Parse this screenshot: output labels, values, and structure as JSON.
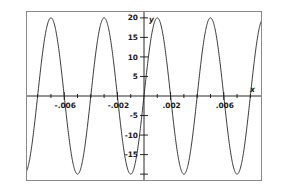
{
  "figure": {
    "background_color": "#ffffff",
    "frame_color": "#8a8a8a",
    "curve_color": "#222222",
    "axis_color": "#111111"
  },
  "axes": {
    "x_axis_name": "x",
    "y_axis_name": "y",
    "x_tick_labels": [
      "-.006",
      "-.002",
      ".002",
      ".006"
    ],
    "x_tick_values": [
      -0.006,
      -0.002,
      0.002,
      0.006
    ],
    "y_tick_labels": [
      "20",
      "15",
      "10",
      "5",
      "-5",
      "-10",
      "-15"
    ],
    "y_tick_values": [
      20,
      15,
      10,
      5,
      -5,
      -10,
      -15
    ]
  },
  "chart_data": {
    "type": "line",
    "title": "",
    "xlabel": "x",
    "ylabel": "y",
    "xlim": [
      -0.0088,
      0.0088
    ],
    "ylim": [
      -21.5,
      21.5
    ],
    "grid": false,
    "legend": null,
    "x_tick_labels": [
      "-.006",
      "-.002",
      ".002",
      ".006"
    ],
    "x_ticks": [
      -0.006,
      -0.002,
      0.002,
      0.006
    ],
    "x_minor_ticks": [
      -0.008,
      -0.007,
      -0.005,
      -0.004,
      -0.003,
      -0.001,
      0.001,
      0.003,
      0.004,
      0.005,
      0.007,
      0.008
    ],
    "y_ticks": [
      -20,
      -15,
      -10,
      -5,
      5,
      10,
      15,
      20
    ],
    "y_tick_labels": [
      "",
      "-15",
      "-10",
      "-5",
      "5",
      "10",
      "15",
      "20"
    ],
    "series": [
      {
        "name": "y",
        "function": "20*sin(2*pi*x/0.004)",
        "amplitude": 20,
        "period": 0.004,
        "phase": 0,
        "x": [
          -0.0088,
          -0.0085,
          -0.008,
          -0.0075,
          -0.007,
          -0.0065,
          -0.006,
          -0.0055,
          -0.005,
          -0.0045,
          -0.004,
          -0.0035,
          -0.003,
          -0.0025,
          -0.002,
          -0.0015,
          -0.001,
          -0.0005,
          0,
          0.0005,
          0.001,
          0.0015,
          0.002,
          0.0025,
          0.003,
          0.0035,
          0.004,
          0.0045,
          0.005,
          0.0055,
          0.006,
          0.0065,
          0.007,
          0.0075,
          0.008,
          0.0085,
          0.0088
        ],
        "values": [
          14.1,
          18.5,
          20.0,
          14.1,
          0.0,
          -14.1,
          -20.0,
          -14.1,
          0.0,
          14.1,
          20.0,
          14.1,
          0.0,
          -14.1,
          -20.0,
          -14.1,
          0.0,
          14.1,
          20.0,
          14.1,
          0.0,
          -14.1,
          -20.0,
          -14.1,
          0.0,
          14.1,
          20.0,
          14.1,
          0.0,
          -14.1,
          -20.0,
          -14.1,
          0.0,
          14.1,
          20.0,
          18.5,
          14.1
        ]
      }
    ]
  }
}
